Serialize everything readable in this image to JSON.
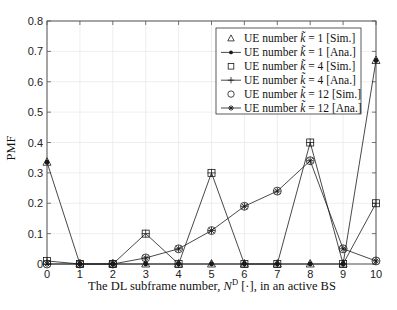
{
  "chart_data": {
    "type": "line",
    "title": "",
    "xlabel": "The DL subframe number, N^D [·], in an active BS",
    "ylabel": "PMF",
    "xlim": [
      0,
      10
    ],
    "ylim": [
      0,
      0.8
    ],
    "grid": true,
    "legend_position": "upper right",
    "x": [
      0,
      1,
      2,
      3,
      4,
      5,
      6,
      7,
      8,
      9,
      10
    ],
    "x_ticks": [
      "0",
      "1",
      "2",
      "3",
      "4",
      "5",
      "6",
      "7",
      "8",
      "9",
      "10"
    ],
    "y_ticks": [
      "0",
      "0.1",
      "0.2",
      "0.3",
      "0.4",
      "0.5",
      "0.6",
      "0.7",
      "0.8"
    ],
    "series": [
      {
        "name": "UE number k̃ = 1 [Sim.]",
        "marker": "triangle",
        "line": false,
        "values": [
          0.335,
          0,
          0,
          0,
          0,
          0,
          0,
          0,
          0,
          0,
          0.67
        ]
      },
      {
        "name": "UE number k̃ = 1 [Ana.]",
        "marker": "dot",
        "line": true,
        "values": [
          0.335,
          0,
          0,
          0,
          0,
          0,
          0,
          0,
          0,
          0,
          0.67
        ]
      },
      {
        "name": "UE number k̃ = 4 [Sim.]",
        "marker": "square",
        "line": false,
        "values": [
          0.01,
          0,
          0,
          0.1,
          0,
          0.3,
          0,
          0,
          0.4,
          0,
          0.2
        ]
      },
      {
        "name": "UE number k̃ = 4 [Ana.]",
        "marker": "plus",
        "line": true,
        "values": [
          0.01,
          0,
          0,
          0.1,
          0,
          0.3,
          0,
          0,
          0.4,
          0,
          0.2
        ]
      },
      {
        "name": "UE number k̃ = 12 [Sim.]",
        "marker": "circle",
        "line": false,
        "values": [
          0.0,
          0,
          0,
          0.02,
          0.05,
          0.11,
          0.19,
          0.24,
          0.34,
          0.05,
          0.01
        ]
      },
      {
        "name": "UE number k̃ = 12 [Ana.]",
        "marker": "asterisk",
        "line": true,
        "values": [
          0.0,
          0,
          0,
          0.02,
          0.05,
          0.11,
          0.19,
          0.24,
          0.34,
          0.05,
          0.01
        ]
      }
    ]
  },
  "axes": {
    "ylabel": "PMF",
    "xlabel_prefix": "The DL subframe number, ",
    "xlabel_var": "N",
    "xlabel_sup": "D",
    "xlabel_suffix": " [·], in an active BS"
  },
  "legend": [
    {
      "prefix": "UE number ",
      "k": "k̃",
      "suffix": " = 1 [Sim.]"
    },
    {
      "prefix": "UE number ",
      "k": "k̃",
      "suffix": " = 1 [Ana.]"
    },
    {
      "prefix": "UE number ",
      "k": "k̃",
      "suffix": " = 4 [Sim.]"
    },
    {
      "prefix": "UE number ",
      "k": "k̃",
      "suffix": " = 4 [Ana.]"
    },
    {
      "prefix": "UE number ",
      "k": "k̃",
      "suffix": " = 12 [Sim.]"
    },
    {
      "prefix": "UE number ",
      "k": "k̃",
      "suffix": " = 12 [Ana.]"
    }
  ],
  "colors": {
    "line": "#1a1a1a",
    "grid": "#e6e6e6",
    "axis": "#555555"
  }
}
